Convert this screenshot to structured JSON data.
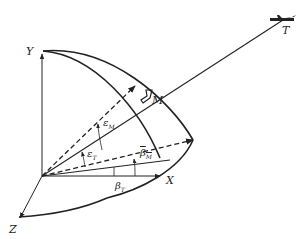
{
  "diagram": {
    "type": "missile-target engagement geometry",
    "axes": {
      "x": "X",
      "y": "Y",
      "z": "Z"
    },
    "points": {
      "missile": "M",
      "target": "T"
    },
    "angles": {
      "epsilon_m": {
        "symbol": "ε",
        "sub": "M"
      },
      "epsilon_t": {
        "symbol": "ε",
        "sub": "T"
      },
      "beta_m": {
        "symbol": "β",
        "sub": "M"
      },
      "beta_t": {
        "symbol": "β",
        "sub": "T"
      }
    },
    "colors": {
      "line": "#222222",
      "background": "#ffffff"
    }
  }
}
